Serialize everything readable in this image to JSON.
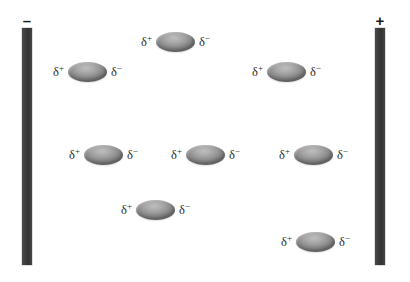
{
  "figure": {
    "background_color": "#ffffff"
  },
  "electrodes": {
    "negative": {
      "sign_label": "–",
      "name": "negative-electrode",
      "color": "#3c3c3c",
      "x": 22,
      "y": 28,
      "width": 10,
      "height": 237,
      "label_x": 22,
      "label_y": 13,
      "label_width": 10
    },
    "positive": {
      "sign_label": "+",
      "name": "positive-electrode",
      "color": "#3c3c3c",
      "x": 375,
      "y": 28,
      "width": 10,
      "height": 237,
      "label_x": 375,
      "label_y": 13,
      "label_width": 10
    }
  },
  "charge_labels": {
    "delta_positive": "δ",
    "delta_positive_sup": "+",
    "delta_negative": "δ",
    "delta_negative_sup": "−"
  },
  "molecules": [
    {
      "id": "dipole-1",
      "label": "top-center",
      "x": 141,
      "y": 32
    },
    {
      "id": "dipole-2",
      "label": "upper-left",
      "x": 53,
      "y": 62
    },
    {
      "id": "dipole-3",
      "label": "upper-right",
      "x": 252,
      "y": 62
    },
    {
      "id": "dipole-4",
      "label": "middle-left",
      "x": 69,
      "y": 145
    },
    {
      "id": "dipole-5",
      "label": "middle-center",
      "x": 171,
      "y": 145
    },
    {
      "id": "dipole-6",
      "label": "middle-right",
      "x": 279,
      "y": 145
    },
    {
      "id": "dipole-7",
      "label": "lower-center",
      "x": 121,
      "y": 200
    },
    {
      "id": "dipole-8",
      "label": "lower-right",
      "x": 281,
      "y": 232
    }
  ]
}
